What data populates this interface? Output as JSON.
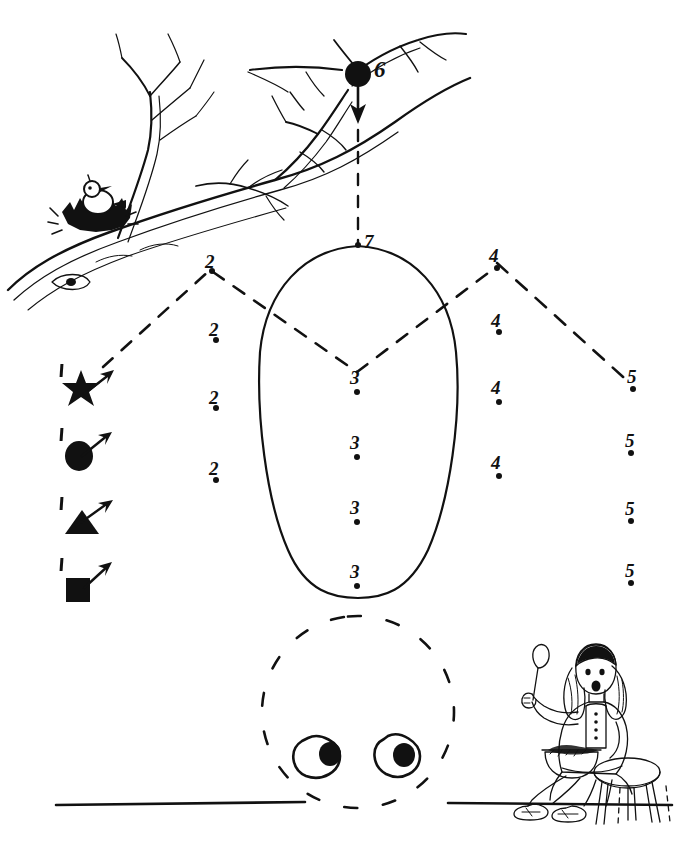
{
  "worksheet": {
    "title": "Dot-to-dot tracing practice worksheet",
    "ink_color": "#111111",
    "paper_color": "#ffffff"
  },
  "start_markers": [
    {
      "shape": "star",
      "label": "1",
      "name": "start-marker-star"
    },
    {
      "shape": "circle",
      "label": "1",
      "name": "start-marker-circle"
    },
    {
      "shape": "triangle",
      "label": "1",
      "name": "start-marker-triangle"
    },
    {
      "shape": "square",
      "label": "1",
      "name": "start-marker-square"
    }
  ],
  "dots": {
    "column_two": {
      "label": "2",
      "count": 4,
      "values": [
        "2",
        "2",
        "2",
        "2"
      ]
    },
    "column_three": {
      "label": "3",
      "count": 4,
      "values": [
        "3",
        "3",
        "3",
        "3"
      ]
    },
    "column_four": {
      "label": "4",
      "count": 4,
      "values": [
        "4",
        "4",
        "4",
        "4"
      ]
    },
    "column_five": {
      "label": "5",
      "count": 4,
      "values": [
        "5",
        "5",
        "5",
        "5"
      ]
    },
    "branch_dot": {
      "label": "6"
    },
    "apex_dot": {
      "label": "7"
    }
  },
  "illustrations": {
    "tree_branch": "bare-branch-with-bird-nest",
    "bird": "bird-in-nest",
    "egg_shape": "large-egg-outline",
    "dashed_head": "dashed-circle-face",
    "eyes": "two-eyes-with-pupils",
    "girl": "girl-sitting-on-stool-with-bowl-and-spoon",
    "ground_line_left": "ground-line",
    "ground_line_right": "ground-line"
  }
}
